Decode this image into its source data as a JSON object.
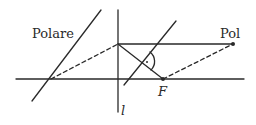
{
  "diagram": {
    "labels": {
      "polare": "Polare",
      "pol": "Pol",
      "focus": "F",
      "line_l": "l"
    },
    "colors": {
      "stroke": "#2a2a2a",
      "background": "#ffffff"
    },
    "elements": [
      {
        "name": "horizontal-axis",
        "type": "line",
        "from": [
          16,
          79
        ],
        "to": [
          244,
          79
        ]
      },
      {
        "name": "line-l",
        "type": "line",
        "from": [
          118,
          10
        ],
        "to": [
          118,
          112
        ]
      },
      {
        "name": "polar-line",
        "type": "line",
        "from": [
          32,
          101
        ],
        "to": [
          101,
          10
        ]
      },
      {
        "name": "tangent-line",
        "type": "line",
        "from": [
          124,
          85
        ],
        "to": [
          176,
          21
        ]
      },
      {
        "name": "top-horizontal",
        "type": "line",
        "from": [
          118,
          44
        ],
        "to": [
          233,
          44
        ]
      },
      {
        "name": "focal-segment",
        "type": "line",
        "from": [
          118,
          44
        ],
        "to": [
          163,
          79
        ]
      },
      {
        "name": "dashed-left",
        "type": "dashed",
        "from": [
          51,
          79
        ],
        "to": [
          118,
          44
        ]
      },
      {
        "name": "dashed-right",
        "type": "dashed",
        "from": [
          163,
          79
        ],
        "to": [
          233,
          44
        ]
      },
      {
        "name": "pol-point",
        "type": "point",
        "at": [
          233,
          44
        ]
      },
      {
        "name": "focus-point",
        "type": "point",
        "at": [
          163,
          79
        ]
      }
    ]
  }
}
